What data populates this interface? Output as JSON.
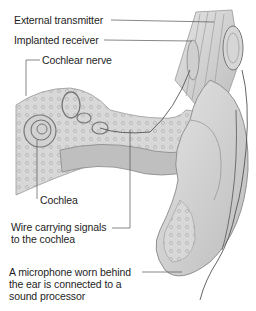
{
  "diagram": {
    "colors": {
      "ink": "#1e1e1e",
      "leader": "#555555",
      "tissue": "#cfcfcf",
      "tissue_dark": "#9a9a9a",
      "background": "#ffffff"
    },
    "labels": [
      {
        "id": "external-transmitter",
        "text": "External transmitter",
        "x": 14,
        "y": 13
      },
      {
        "id": "implanted-receiver",
        "text": "Implanted receiver",
        "x": 14,
        "y": 33
      },
      {
        "id": "cochlear-nerve",
        "text": "Cochlear nerve",
        "x": 41,
        "y": 53
      },
      {
        "id": "cochlea",
        "text": "Cochlea",
        "x": 40,
        "y": 193
      },
      {
        "id": "wire",
        "lines": [
          "Wire carrying signals",
          "to the cochlea"
        ],
        "x": 11,
        "y": 219
      },
      {
        "id": "microphone",
        "lines": [
          "A microphone worn behind",
          "the ear is connected to a",
          "sound processor"
        ],
        "x": 9,
        "y": 266
      }
    ]
  }
}
